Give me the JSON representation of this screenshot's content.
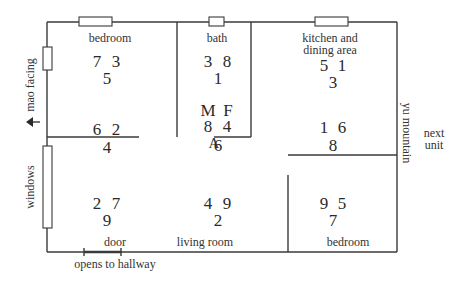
{
  "figure": {
    "caption": "A",
    "labels": {
      "bedroom_top": "bedroom",
      "bath": "bath",
      "kitchen_line1": "kitchen and",
      "kitchen_line2": "dining area",
      "mao_facing": "mao facing",
      "yu_mountain": "yu mountain",
      "next_unit_line1": "next",
      "next_unit_line2": "unit",
      "windows": "windows",
      "door": "door",
      "opens_to_hallway": "opens to hallway",
      "living_room": "living room",
      "bedroom_bottom": "bedroom",
      "male": "M",
      "female": "F"
    },
    "grids": {
      "bedroom_top": {
        "top_left": "7",
        "top_right": "3",
        "bottom": "5"
      },
      "bath": {
        "top_left": "3",
        "top_right": "8",
        "bottom": "1"
      },
      "kitchen": {
        "top_left": "5",
        "top_right": "1",
        "bottom": "3"
      },
      "west_middle": {
        "top_left": "6",
        "top_right": "2",
        "bottom": "4"
      },
      "center": {
        "top_left": "8",
        "top_right": "4",
        "bottom": "6"
      },
      "east_middle": {
        "top_left": "1",
        "top_right": "6",
        "bottom": "8"
      },
      "southwest": {
        "top_left": "2",
        "top_right": "7",
        "bottom": "9"
      },
      "south_center": {
        "top_left": "4",
        "top_right": "9",
        "bottom": "2"
      },
      "southeast": {
        "top_left": "9",
        "top_right": "5",
        "bottom": "7"
      }
    }
  }
}
